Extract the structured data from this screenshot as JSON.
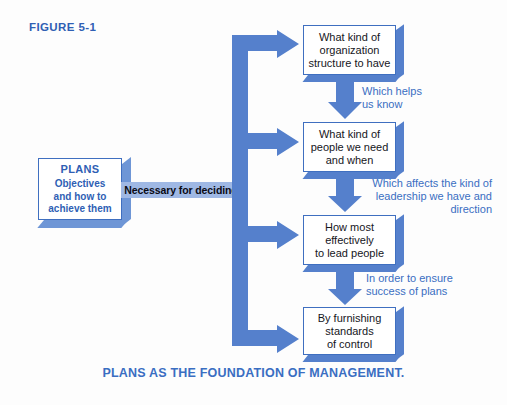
{
  "figure": {
    "label": "FIGURE 5-1",
    "caption": "PLANS AS THE FOUNDATION OF MANAGEMENT."
  },
  "plans_box": {
    "title": "PLANS",
    "line1": "Objectives",
    "line2": "and how to",
    "line3": "achieve them"
  },
  "trunk": {
    "label": "Necessary for deciding"
  },
  "boxes": [
    {
      "id": "organization-structure",
      "line1": "What kind of",
      "line2": "organization",
      "line3": "structure to have"
    },
    {
      "id": "people-needed",
      "line1": "What kind of",
      "line2": "people we need",
      "line3": "and when"
    },
    {
      "id": "lead-people",
      "line1": "How most",
      "line2": "effectively",
      "line3": "to lead people"
    },
    {
      "id": "standards-of-control",
      "line1": "By furnishing",
      "line2": "standards",
      "line3": "of control"
    }
  ],
  "connectors": [
    {
      "id": "which-helps-us-know",
      "line1": "Which helps",
      "line2": "us know"
    },
    {
      "id": "which-affects-leadership",
      "line1": "Which affects the kind of",
      "line2": "leadership we have and",
      "line3": "direction"
    },
    {
      "id": "in-order-to-ensure",
      "line1": "In order to ensure",
      "line2": "success of plans"
    }
  ],
  "colors": {
    "accent_blue": "#5580cc",
    "text_blue": "#3a6ec2",
    "deep_blue": "#2f5fb4",
    "band_blue": "#9fb8e4",
    "box_border": "#3f6fc0",
    "box_fill": "#ffffff",
    "background": "#fdfdfd"
  }
}
